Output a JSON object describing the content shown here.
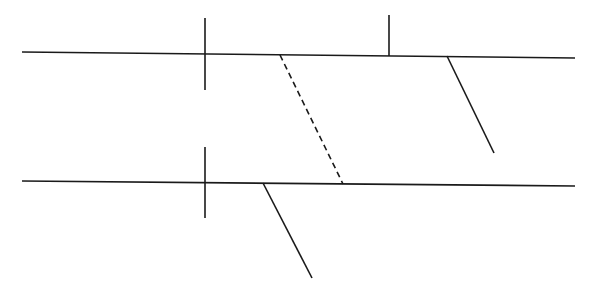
{
  "diagram": {
    "width": 589,
    "height": 287,
    "background": "#ffffff",
    "stroke_color": "#1a1a1a",
    "stroke_width": 1.6,
    "segments": [
      {
        "id": "top-line",
        "x1": 22,
        "y1": 52,
        "x2": 575,
        "y2": 58,
        "style": "solid"
      },
      {
        "id": "top-left-tick",
        "x1": 205,
        "y1": 18,
        "x2": 205,
        "y2": 90,
        "style": "solid"
      },
      {
        "id": "top-right-tick",
        "x1": 389,
        "y1": 15,
        "x2": 389,
        "y2": 56,
        "style": "solid"
      },
      {
        "id": "top-slant",
        "x1": 447,
        "y1": 56,
        "x2": 494,
        "y2": 153,
        "style": "solid"
      },
      {
        "id": "dashed-transversal",
        "x1": 280,
        "y1": 55,
        "x2": 343,
        "y2": 184,
        "style": "dashed"
      },
      {
        "id": "bottom-line",
        "x1": 22,
        "y1": 181,
        "x2": 575,
        "y2": 186,
        "style": "solid"
      },
      {
        "id": "bottom-left-tick",
        "x1": 205,
        "y1": 147,
        "x2": 205,
        "y2": 218,
        "style": "solid"
      },
      {
        "id": "bottom-slant",
        "x1": 263,
        "y1": 183,
        "x2": 312,
        "y2": 278,
        "style": "solid"
      }
    ]
  }
}
